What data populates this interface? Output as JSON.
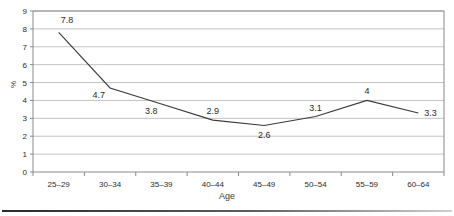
{
  "chart_data": {
    "type": "line",
    "title": "",
    "subtitle": "",
    "xlabel": "Age",
    "ylabel": "%",
    "categories": [
      "25–29",
      "30–34",
      "35–39",
      "40–44",
      "45–49",
      "50–54",
      "55–59",
      "60–64"
    ],
    "values": [
      7.8,
      4.7,
      3.8,
      2.9,
      2.6,
      3.1,
      4,
      3.3
    ],
    "point_labels": [
      "7.8",
      "4.7",
      "3.8",
      "2.9",
      "2.6",
      "3.1",
      "4",
      "3.3"
    ],
    "ylim": [
      0,
      9
    ],
    "ytick_labels": [
      "9",
      "8",
      "7",
      "6",
      "5",
      "4",
      "3",
      "2",
      "1",
      "0"
    ],
    "yticks": [
      9,
      8,
      7,
      6,
      5,
      4,
      3,
      2,
      1,
      0
    ],
    "grid": true,
    "grid_axis": "y",
    "legend": false,
    "legend_position": "none",
    "markers": false,
    "series_color": "#3a3a3a",
    "grid_color": "#c3c3c3",
    "axis_color": "#8a8a8a",
    "plot_background": "#ffffff"
  }
}
